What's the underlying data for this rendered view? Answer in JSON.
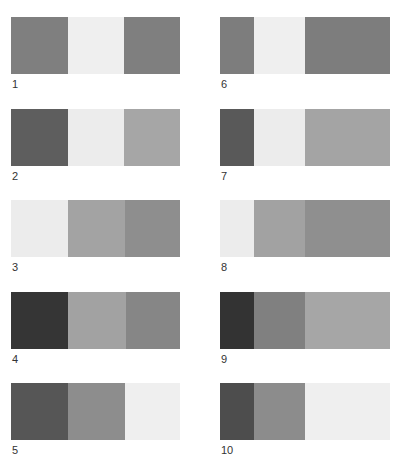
{
  "figure": {
    "items": [
      {
        "label": "1",
        "x": 11,
        "y": 17,
        "blocks": [
          {
            "w": 57,
            "c": "#7f7f7f"
          },
          {
            "w": 56,
            "c": "#efefef"
          },
          {
            "w": 56,
            "c": "#7f7f7f"
          }
        ]
      },
      {
        "label": "2",
        "x": 11,
        "y": 109,
        "blocks": [
          {
            "w": 57,
            "c": "#5e5e5e"
          },
          {
            "w": 56,
            "c": "#ececec"
          },
          {
            "w": 56,
            "c": "#a6a6a6"
          }
        ]
      },
      {
        "label": "3",
        "x": 11,
        "y": 200,
        "blocks": [
          {
            "w": 57,
            "c": "#ececec"
          },
          {
            "w": 57,
            "c": "#a3a3a3"
          },
          {
            "w": 55,
            "c": "#8e8e8e"
          }
        ]
      },
      {
        "label": "4",
        "x": 11,
        "y": 292,
        "blocks": [
          {
            "w": 57,
            "c": "#353535"
          },
          {
            "w": 58,
            "c": "#a2a2a2"
          },
          {
            "w": 54,
            "c": "#868686"
          }
        ]
      },
      {
        "label": "5",
        "x": 11,
        "y": 383,
        "blocks": [
          {
            "w": 57,
            "c": "#565656"
          },
          {
            "w": 57,
            "c": "#8d8d8d"
          },
          {
            "w": 55,
            "c": "#efefef"
          }
        ]
      },
      {
        "label": "6",
        "x": 220,
        "y": 17,
        "blocks": [
          {
            "w": 34,
            "c": "#7d7d7d"
          },
          {
            "w": 51,
            "c": "#efefef"
          },
          {
            "w": 85,
            "c": "#7d7d7d"
          }
        ]
      },
      {
        "label": "7",
        "x": 220,
        "y": 109,
        "blocks": [
          {
            "w": 34,
            "c": "#595959"
          },
          {
            "w": 51,
            "c": "#ececec"
          },
          {
            "w": 85,
            "c": "#a4a4a4"
          }
        ]
      },
      {
        "label": "8",
        "x": 220,
        "y": 200,
        "blocks": [
          {
            "w": 34,
            "c": "#ececec"
          },
          {
            "w": 51,
            "c": "#a2a2a2"
          },
          {
            "w": 85,
            "c": "#8f8f8f"
          }
        ]
      },
      {
        "label": "9",
        "x": 220,
        "y": 292,
        "blocks": [
          {
            "w": 34,
            "c": "#333333"
          },
          {
            "w": 51,
            "c": "#808080"
          },
          {
            "w": 85,
            "c": "#a6a6a6"
          }
        ]
      },
      {
        "label": "10",
        "x": 220,
        "y": 383,
        "blocks": [
          {
            "w": 34,
            "c": "#4d4d4d"
          },
          {
            "w": 51,
            "c": "#8c8c8c"
          },
          {
            "w": 85,
            "c": "#efefef"
          }
        ]
      }
    ]
  }
}
